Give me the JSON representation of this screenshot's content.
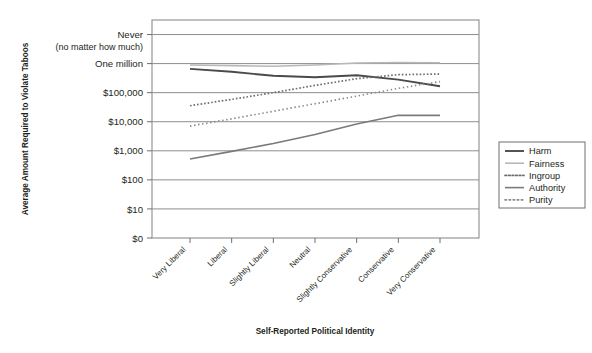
{
  "chart_data": {
    "type": "line",
    "title": "",
    "xlabel": "Self-Reported Political Identity",
    "ylabel": "Average Amount Required to Violate Taboos",
    "categories": [
      "Very Liberal",
      "Liberal",
      "Slightly Liberal",
      "Neutral",
      "Slightly Conservative",
      "Conservative",
      "Very Conservative"
    ],
    "ytick_labels": [
      "$0",
      "$10",
      "$100",
      "$1,000",
      "$10,000",
      "$100,000",
      "One million",
      "Never"
    ],
    "ytick_sublabel": "(no matter how much)",
    "ytick_values": [
      0,
      1,
      2,
      3,
      4,
      5,
      6,
      7
    ],
    "ylim": [
      0,
      7.5
    ],
    "grid": "horizontal",
    "legend_position": "right",
    "series": [
      {
        "name": "Harm",
        "style": "solid",
        "color": "#4a4a4a",
        "width": 1.9,
        "values": [
          5.82,
          5.72,
          5.58,
          5.53,
          5.6,
          5.45,
          5.22
        ]
      },
      {
        "name": "Fairness",
        "style": "solid",
        "color": "#b8b8b8",
        "width": 1.6,
        "values": [
          5.95,
          5.93,
          5.91,
          5.95,
          6.02,
          6.04,
          6.03
        ]
      },
      {
        "name": "Ingroup",
        "style": "dotted-fine",
        "color": "#6e6e6e",
        "width": 1.7,
        "values": [
          4.55,
          4.77,
          5.0,
          5.25,
          5.48,
          5.62,
          5.64
        ]
      },
      {
        "name": "Authority",
        "style": "solid",
        "color": "#7a7a7a",
        "width": 1.6,
        "values": [
          2.72,
          2.98,
          3.25,
          3.56,
          3.92,
          4.22,
          4.22
        ]
      },
      {
        "name": "Purity",
        "style": "dotted-coarse",
        "color": "#8a8a8a",
        "width": 1.7,
        "values": [
          3.85,
          4.1,
          4.36,
          4.62,
          4.88,
          5.15,
          5.38
        ]
      }
    ]
  },
  "legend": {
    "entries": [
      "Harm",
      "Fairness",
      "Ingroup",
      "Authority",
      "Purity"
    ]
  }
}
